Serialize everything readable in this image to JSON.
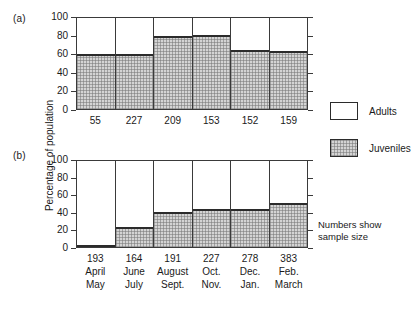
{
  "figure": {
    "y_axis_title": "Percentage of population",
    "note": "Numbers show\nsample size",
    "panel_a_letter": "(a)",
    "panel_b_letter": "(b)"
  },
  "legend": {
    "position": "right",
    "items": [
      {
        "label": "Adults",
        "swatch": "white-box",
        "color": "#ffffff"
      },
      {
        "label": "Juveniles",
        "swatch": "stippled-gray-box",
        "color": "#d4d4d4"
      }
    ]
  },
  "chart_data": [
    {
      "type": "bar",
      "panel": "(a)",
      "title": "",
      "xlabel": "",
      "ylabel": "Percentage of population",
      "ylim": [
        0,
        100
      ],
      "yticks": [
        0,
        20,
        40,
        60,
        80,
        100
      ],
      "grid": false,
      "stacked": true,
      "categories": [
        "April May",
        "June July",
        "August Sept.",
        "Oct. Nov.",
        "Dec. Jan.",
        "Feb. March"
      ],
      "sample_sizes": [
        55,
        227,
        209,
        153,
        152,
        159
      ],
      "series": [
        {
          "name": "Juveniles",
          "values": [
            60,
            61,
            80,
            81,
            65,
            64
          ]
        },
        {
          "name": "Adults",
          "values": [
            40,
            39,
            20,
            19,
            35,
            36
          ]
        }
      ]
    },
    {
      "type": "bar",
      "panel": "(b)",
      "title": "",
      "xlabel": "",
      "ylabel": "Percentage of population",
      "ylim": [
        0,
        100
      ],
      "yticks": [
        0,
        20,
        40,
        60,
        80,
        100
      ],
      "grid": false,
      "stacked": true,
      "categories": [
        "April May",
        "June July",
        "August Sept.",
        "Oct. Nov.",
        "Dec. Jan.",
        "Feb. March"
      ],
      "sample_sizes": [
        193,
        164,
        191,
        227,
        278,
        383
      ],
      "series": [
        {
          "name": "Juveniles",
          "values": [
            2,
            23,
            41,
            44,
            44,
            51
          ]
        },
        {
          "name": "Adults",
          "values": [
            98,
            77,
            59,
            56,
            56,
            49
          ]
        }
      ]
    }
  ],
  "axis_a": {
    "ticks": [
      {
        "label": "100",
        "value": 100
      },
      {
        "label": "80",
        "value": 80
      },
      {
        "label": "60",
        "value": 60
      },
      {
        "label": "40",
        "value": 40
      },
      {
        "label": "20",
        "value": 20
      },
      {
        "label": "0",
        "value": 0
      }
    ]
  },
  "axis_b": {
    "ticks": [
      {
        "label": "100",
        "value": 100
      },
      {
        "label": "80",
        "value": 80
      },
      {
        "label": "60",
        "value": 60
      },
      {
        "label": "40",
        "value": 40
      },
      {
        "label": "20",
        "value": 20
      },
      {
        "label": "0",
        "value": 0
      }
    ]
  },
  "xaxis_a": {
    "columns": [
      {
        "n": "55"
      },
      {
        "n": "227"
      },
      {
        "n": "209"
      },
      {
        "n": "153"
      },
      {
        "n": "152"
      },
      {
        "n": "159"
      }
    ]
  },
  "xaxis_b": {
    "columns": [
      {
        "n": "193",
        "m1": "April",
        "m2": "May"
      },
      {
        "n": "164",
        "m1": "June",
        "m2": "July"
      },
      {
        "n": "191",
        "m1": "August",
        "m2": "Sept."
      },
      {
        "n": "227",
        "m1": "Oct.",
        "m2": "Nov."
      },
      {
        "n": "278",
        "m1": "Dec.",
        "m2": "Jan."
      },
      {
        "n": "383",
        "m1": "Feb.",
        "m2": "March"
      }
    ]
  }
}
